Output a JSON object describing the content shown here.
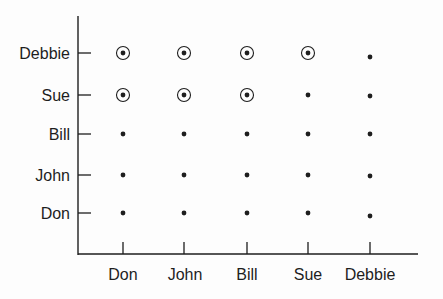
{
  "chart_data": {
    "type": "scatter",
    "title": "",
    "xlabel": "",
    "ylabel": "",
    "grid": false,
    "legend": null,
    "x_categories": [
      "Don",
      "John",
      "Bill",
      "Sue",
      "Debbie"
    ],
    "y_categories": [
      "Don",
      "John",
      "Bill",
      "Sue",
      "Debbie"
    ],
    "points": [
      {
        "x": "Don",
        "y": "Don",
        "circled": false
      },
      {
        "x": "John",
        "y": "Don",
        "circled": false
      },
      {
        "x": "Bill",
        "y": "Don",
        "circled": false
      },
      {
        "x": "Sue",
        "y": "Don",
        "circled": false
      },
      {
        "x": "Debbie",
        "y": "Don",
        "circled": false
      },
      {
        "x": "Don",
        "y": "John",
        "circled": false
      },
      {
        "x": "John",
        "y": "John",
        "circled": false
      },
      {
        "x": "Bill",
        "y": "John",
        "circled": false
      },
      {
        "x": "Sue",
        "y": "John",
        "circled": false
      },
      {
        "x": "Debbie",
        "y": "John",
        "circled": false
      },
      {
        "x": "Don",
        "y": "Bill",
        "circled": false
      },
      {
        "x": "John",
        "y": "Bill",
        "circled": false
      },
      {
        "x": "Bill",
        "y": "Bill",
        "circled": false
      },
      {
        "x": "Sue",
        "y": "Bill",
        "circled": false
      },
      {
        "x": "Debbie",
        "y": "Bill",
        "circled": false
      },
      {
        "x": "Don",
        "y": "Sue",
        "circled": true
      },
      {
        "x": "John",
        "y": "Sue",
        "circled": true
      },
      {
        "x": "Bill",
        "y": "Sue",
        "circled": true
      },
      {
        "x": "Sue",
        "y": "Sue",
        "circled": false
      },
      {
        "x": "Debbie",
        "y": "Sue",
        "circled": false
      },
      {
        "x": "Don",
        "y": "Debbie",
        "circled": true
      },
      {
        "x": "John",
        "y": "Debbie",
        "circled": true
      },
      {
        "x": "Bill",
        "y": "Debbie",
        "circled": true
      },
      {
        "x": "Sue",
        "y": "Debbie",
        "circled": true
      },
      {
        "x": "Debbie",
        "y": "Debbie",
        "circled": false
      }
    ],
    "colors": {
      "ink": "#1e1e1e",
      "background": "#fdfdfd"
    }
  },
  "axes": {
    "x_ticks": [
      "Don",
      "John",
      "Bill",
      "Sue",
      "Debbie"
    ],
    "y_ticks": [
      "Debbie",
      "Sue",
      "Bill",
      "John",
      "Don"
    ]
  }
}
